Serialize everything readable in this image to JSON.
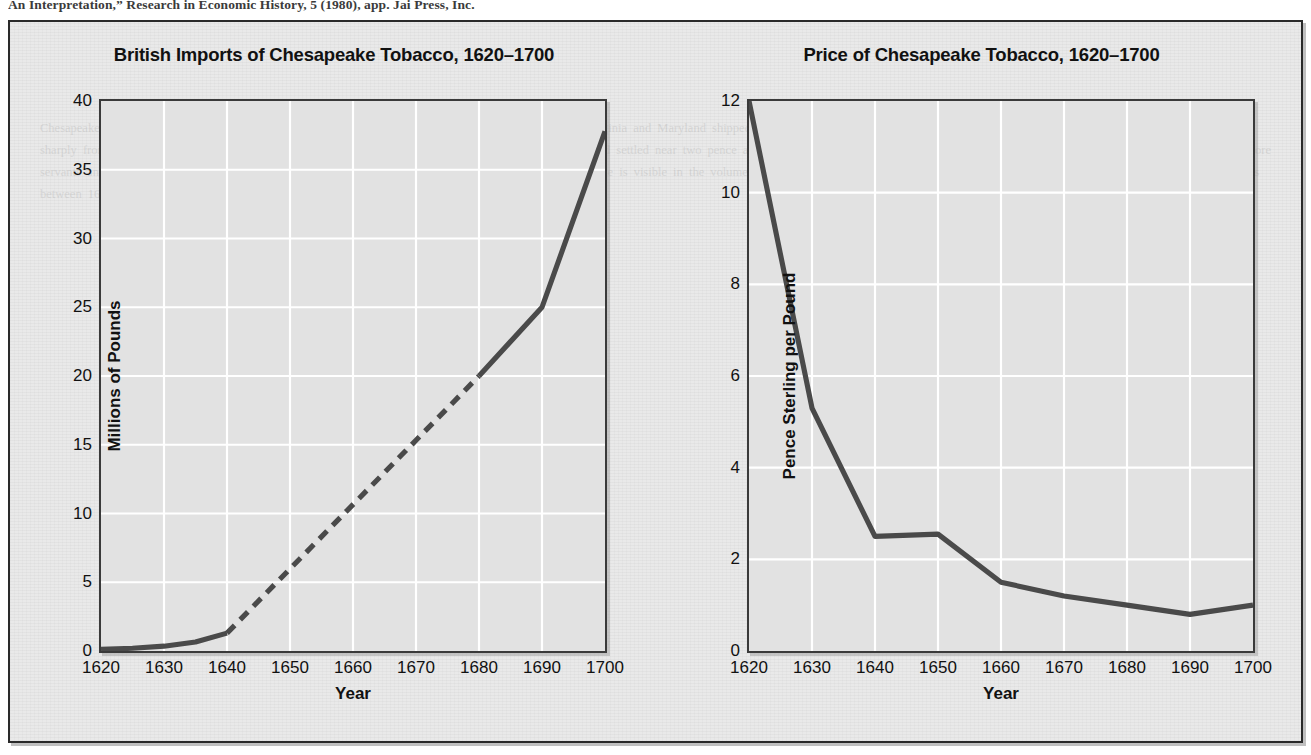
{
  "page": {
    "bleed_text": "An Interpretation,” Research in Economic History, 5 (1980), app. Jai Press, Inc.",
    "ghost_text": "Chesapeake tobacco planters faced a long era of falling prices as output expanded. The colonists of Virginia and Maryland shipped ever larger quantities of leaf to English merchants, and the price per pound of sterling fell sharply from the early boom years of the 1620s. By the middle of the seventeenth century the price had settled near two pence and continued a slow decline thereafter. Planters responded by increasing acreage, importing more servants and slaves, and by seeking greater efficiency in cultivation and packing. The growth of the trade is visible in the volume series shown at the left, where the dashed segment indicates interpolated values for the years between 1640 and 1680 for which continuous records are lacking."
  },
  "colors": {
    "plot_background": "#e2e2e2",
    "figure_background": "#e9e9e9",
    "gridline": "#ffffff",
    "data_line": "#4a4a4a",
    "frame": "#3a3a3a",
    "text": "#111111"
  },
  "chart_data": [
    {
      "type": "line",
      "title": "British Imports of Chesapeake Tobacco, 1620–1700",
      "xlabel": "Year",
      "ylabel": "Millions of Pounds",
      "xlim": [
        1620,
        1700
      ],
      "ylim": [
        0,
        40
      ],
      "xticks": [
        1620,
        1630,
        1640,
        1650,
        1660,
        1670,
        1680,
        1690,
        1700
      ],
      "yticks": [
        0,
        5,
        10,
        15,
        20,
        25,
        30,
        35,
        40
      ],
      "grid": true,
      "legend": "none",
      "series": [
        {
          "name": "Imports (observed, early)",
          "style": "solid",
          "x": [
            1620,
            1625,
            1630,
            1635,
            1640
          ],
          "values": [
            0.12,
            0.2,
            0.35,
            0.65,
            1.3
          ]
        },
        {
          "name": "Imports (interpolated)",
          "style": "dashed",
          "x": [
            1640,
            1680
          ],
          "values": [
            1.3,
            20.0
          ]
        },
        {
          "name": "Imports (observed, late)",
          "style": "solid",
          "x": [
            1680,
            1690,
            1700
          ],
          "values": [
            20.0,
            25.0,
            37.8
          ]
        }
      ]
    },
    {
      "type": "line",
      "title": "Price of Chesapeake Tobacco, 1620–1700",
      "xlabel": "Year",
      "ylabel": "Pence Sterling per Pound",
      "xlim": [
        1620,
        1700
      ],
      "ylim": [
        0,
        12
      ],
      "xticks": [
        1620,
        1630,
        1640,
        1650,
        1660,
        1670,
        1680,
        1690,
        1700
      ],
      "yticks": [
        0,
        2,
        4,
        6,
        8,
        10,
        12
      ],
      "grid": true,
      "legend": "none",
      "series": [
        {
          "name": "Price",
          "style": "solid",
          "x": [
            1620,
            1630,
            1640,
            1650,
            1660,
            1670,
            1680,
            1690,
            1700
          ],
          "values": [
            12.0,
            5.3,
            2.5,
            2.55,
            1.5,
            1.2,
            1.0,
            0.8,
            1.0
          ]
        }
      ]
    }
  ]
}
